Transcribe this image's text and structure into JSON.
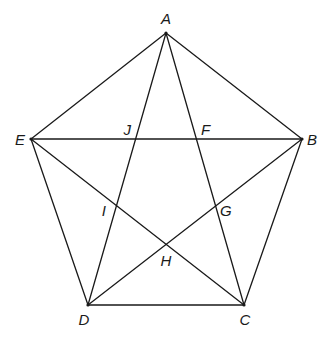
{
  "figure": {
    "stroke_color": "#1a1a1a",
    "background": "#ffffff"
  },
  "points": {
    "A": {
      "label": "A",
      "x": 166,
      "y": 33,
      "lx": 166,
      "ly": 24,
      "anchor": "middle"
    },
    "B": {
      "label": "B",
      "x": 302,
      "y": 139,
      "lx": 307,
      "ly": 145,
      "anchor": "start"
    },
    "C": {
      "label": "C",
      "x": 244,
      "y": 305,
      "lx": 245,
      "ly": 325,
      "anchor": "middle"
    },
    "D": {
      "label": "D",
      "x": 88,
      "y": 305,
      "lx": 84,
      "ly": 325,
      "anchor": "middle"
    },
    "E": {
      "label": "E",
      "x": 31,
      "y": 139,
      "lx": 25,
      "ly": 145,
      "anchor": "end"
    },
    "F": {
      "label": "F",
      "lx": 201,
      "ly": 135,
      "anchor": "start"
    },
    "G": {
      "label": "G",
      "lx": 220,
      "ly": 216,
      "anchor": "start"
    },
    "H": {
      "label": "H",
      "lx": 166,
      "ly": 266,
      "anchor": "middle"
    },
    "I": {
      "label": "I",
      "lx": 106,
      "ly": 216,
      "anchor": "end"
    },
    "J": {
      "label": "J",
      "lx": 131,
      "ly": 135,
      "anchor": "end"
    }
  },
  "pentagon_edges": [
    [
      "A",
      "B"
    ],
    [
      "B",
      "C"
    ],
    [
      "C",
      "D"
    ],
    [
      "D",
      "E"
    ],
    [
      "E",
      "A"
    ]
  ],
  "star_edges": [
    [
      "A",
      "C"
    ],
    [
      "A",
      "D"
    ],
    [
      "E",
      "B"
    ],
    [
      "E",
      "C"
    ],
    [
      "B",
      "D"
    ]
  ]
}
